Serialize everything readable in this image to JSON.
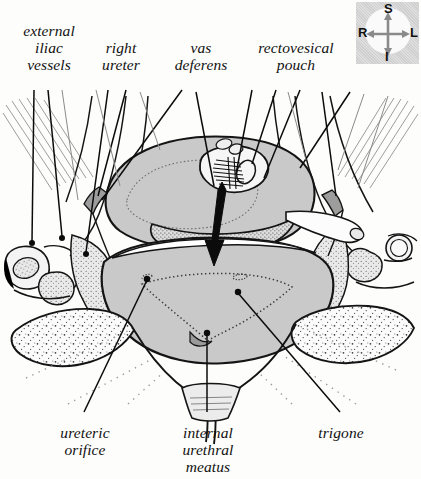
{
  "figure": {
    "type": "anatomical-illustration",
    "view": "axial-cross-section-male-pelvis",
    "background_color": "#fdfdfb",
    "ink_color": "#111111",
    "tissue_fill_color": "#c9c9c9",
    "stipple_fill_color": "#f2f2f2"
  },
  "labels": {
    "top": [
      {
        "id": "external-iliac-vessels",
        "text": "external\niliac\nvessels"
      },
      {
        "id": "right-ureter",
        "text": "right\nureter"
      },
      {
        "id": "vas-deferens",
        "text": "vas\ndeferens"
      },
      {
        "id": "rectovesical-pouch",
        "text": "rectovesical\npouch"
      }
    ],
    "bottom": [
      {
        "id": "ureteric-orifice",
        "text": "ureteric\norifice"
      },
      {
        "id": "internal-urethral-meatus",
        "text": "internal\nurethral\nmeatus"
      },
      {
        "id": "trigone",
        "text": "trigone"
      }
    ]
  },
  "compass": {
    "superior": "S",
    "inferior": "I",
    "right": "R",
    "left": "L"
  }
}
